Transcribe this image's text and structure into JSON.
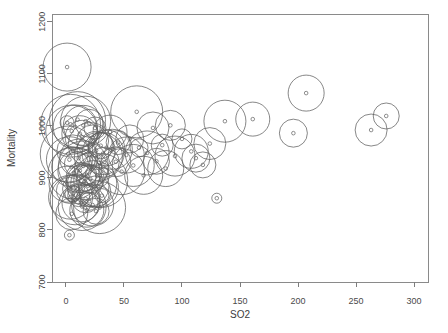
{
  "chart_data": {
    "type": "scatter",
    "title": "",
    "xlabel": "SO2",
    "ylabel": "Mortality",
    "xlim": [
      -12,
      312
    ],
    "ylim": [
      700,
      1215
    ],
    "xticks": [
      0,
      50,
      100,
      150,
      200,
      250,
      300
    ],
    "yticks": [
      700,
      800,
      900,
      1000,
      1100,
      1200
    ],
    "grid": false,
    "legend": null,
    "marker": "open-circle-with-dot",
    "series": [
      {
        "name": "cities",
        "x_label": "SO2",
        "y_label": "Mortality",
        "size_label": "bubble radius",
        "points": [
          {
            "x": 1,
            "y": 1113,
            "r": 24
          },
          {
            "x": 1,
            "y": 1006,
            "r": 7
          },
          {
            "x": 4,
            "y": 1003,
            "r": 30
          },
          {
            "x": 5,
            "y": 990,
            "r": 26
          },
          {
            "x": 8,
            "y": 998,
            "r": 22
          },
          {
            "x": 10,
            "y": 1012,
            "r": 28
          },
          {
            "x": 12,
            "y": 985,
            "r": 18
          },
          {
            "x": 14,
            "y": 978,
            "r": 17
          },
          {
            "x": 15,
            "y": 1001,
            "r": 20
          },
          {
            "x": 17,
            "y": 1009,
            "r": 25
          },
          {
            "x": 20,
            "y": 1005,
            "r": 14
          },
          {
            "x": 21,
            "y": 964,
            "r": 22
          },
          {
            "x": 23,
            "y": 971,
            "r": 16
          },
          {
            "x": 25,
            "y": 996,
            "r": 11
          },
          {
            "x": 26,
            "y": 953,
            "r": 19
          },
          {
            "x": 28,
            "y": 941,
            "r": 24
          },
          {
            "x": 30,
            "y": 962,
            "r": 13
          },
          {
            "x": 32,
            "y": 947,
            "r": 21
          },
          {
            "x": 33,
            "y": 930,
            "r": 15
          },
          {
            "x": 35,
            "y": 958,
            "r": 18
          },
          {
            "x": 2,
            "y": 946,
            "r": 28
          },
          {
            "x": 3,
            "y": 935,
            "r": 23
          },
          {
            "x": 5,
            "y": 921,
            "r": 20
          },
          {
            "x": 6,
            "y": 952,
            "r": 16
          },
          {
            "x": 7,
            "y": 909,
            "r": 26
          },
          {
            "x": 9,
            "y": 927,
            "r": 12
          },
          {
            "x": 11,
            "y": 938,
            "r": 19
          },
          {
            "x": 12,
            "y": 914,
            "r": 22
          },
          {
            "x": 13,
            "y": 901,
            "r": 15
          },
          {
            "x": 15,
            "y": 923,
            "r": 25
          },
          {
            "x": 16,
            "y": 893,
            "r": 18
          },
          {
            "x": 18,
            "y": 906,
            "r": 10
          },
          {
            "x": 19,
            "y": 885,
            "r": 21
          },
          {
            "x": 21,
            "y": 898,
            "r": 14
          },
          {
            "x": 22,
            "y": 917,
            "r": 17
          },
          {
            "x": 24,
            "y": 889,
            "r": 23
          },
          {
            "x": 25,
            "y": 873,
            "r": 16
          },
          {
            "x": 27,
            "y": 904,
            "r": 12
          },
          {
            "x": 28,
            "y": 882,
            "r": 20
          },
          {
            "x": 30,
            "y": 895,
            "r": 27
          },
          {
            "x": 1,
            "y": 888,
            "r": 18
          },
          {
            "x": 3,
            "y": 876,
            "r": 13
          },
          {
            "x": 4,
            "y": 863,
            "r": 22
          },
          {
            "x": 6,
            "y": 870,
            "r": 8
          },
          {
            "x": 8,
            "y": 858,
            "r": 25
          },
          {
            "x": 10,
            "y": 879,
            "r": 15
          },
          {
            "x": 11,
            "y": 866,
            "r": 11
          },
          {
            "x": 13,
            "y": 852,
            "r": 19
          },
          {
            "x": 14,
            "y": 845,
            "r": 24
          },
          {
            "x": 17,
            "y": 860,
            "r": 14
          },
          {
            "x": 18,
            "y": 838,
            "r": 17
          },
          {
            "x": 20,
            "y": 855,
            "r": 9
          },
          {
            "x": 23,
            "y": 848,
            "r": 21
          },
          {
            "x": 26,
            "y": 836,
            "r": 13
          },
          {
            "x": 29,
            "y": 843,
            "r": 26
          },
          {
            "x": 31,
            "y": 866,
            "r": 7
          },
          {
            "x": 5,
            "y": 831,
            "r": 16
          },
          {
            "x": 3,
            "y": 790,
            "r": 5
          },
          {
            "x": 38,
            "y": 988,
            "r": 17
          },
          {
            "x": 40,
            "y": 955,
            "r": 20
          },
          {
            "x": 43,
            "y": 931,
            "r": 15
          },
          {
            "x": 45,
            "y": 968,
            "r": 12
          },
          {
            "x": 48,
            "y": 912,
            "r": 23
          },
          {
            "x": 52,
            "y": 944,
            "r": 18
          },
          {
            "x": 55,
            "y": 975,
            "r": 14
          },
          {
            "x": 58,
            "y": 924,
            "r": 21
          },
          {
            "x": 61,
            "y": 1027,
            "r": 26
          },
          {
            "x": 63,
            "y": 958,
            "r": 9
          },
          {
            "x": 67,
            "y": 905,
            "r": 19
          },
          {
            "x": 70,
            "y": 948,
            "r": 22
          },
          {
            "x": 75,
            "y": 996,
            "r": 16
          },
          {
            "x": 78,
            "y": 932,
            "r": 13
          },
          {
            "x": 83,
            "y": 963,
            "r": 11
          },
          {
            "x": 86,
            "y": 918,
            "r": 18
          },
          {
            "x": 90,
            "y": 1001,
            "r": 15
          },
          {
            "x": 94,
            "y": 942,
            "r": 20
          },
          {
            "x": 100,
            "y": 975,
            "r": 10
          },
          {
            "x": 108,
            "y": 951,
            "r": 17
          },
          {
            "x": 112,
            "y": 938,
            "r": 14
          },
          {
            "x": 118,
            "y": 925,
            "r": 13
          },
          {
            "x": 124,
            "y": 966,
            "r": 16
          },
          {
            "x": 130,
            "y": 861,
            "r": 5
          },
          {
            "x": 137,
            "y": 1009,
            "r": 21
          },
          {
            "x": 161,
            "y": 1013,
            "r": 17
          },
          {
            "x": 196,
            "y": 986,
            "r": 14
          },
          {
            "x": 207,
            "y": 1063,
            "r": 18
          },
          {
            "x": 263,
            "y": 992,
            "r": 16
          },
          {
            "x": 276,
            "y": 1019,
            "r": 13
          }
        ]
      }
    ]
  },
  "axes": {
    "x": {
      "label": "SO2",
      "tick_labels": [
        "0",
        "50",
        "100",
        "150",
        "200",
        "250",
        "300"
      ]
    },
    "y": {
      "label": "Mortality",
      "tick_labels": [
        "700",
        "800",
        "900",
        "1000",
        "1100",
        "1200"
      ]
    }
  }
}
